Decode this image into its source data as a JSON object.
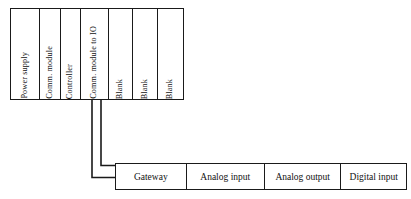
{
  "diagram": {
    "rack": {
      "name": "controller-rack",
      "slots": [
        {
          "label": "Power supply"
        },
        {
          "label": "Comm. module"
        },
        {
          "label": "Controller"
        },
        {
          "label": "Comm. module to IO"
        },
        {
          "label": "Blank"
        },
        {
          "label": "Blank"
        },
        {
          "label": "Blank"
        }
      ]
    },
    "io_bar": {
      "name": "io-module-bar",
      "modules": [
        {
          "label": "Gateway"
        },
        {
          "label": "Analog input"
        },
        {
          "label": "Analog output"
        },
        {
          "label": "Digital input"
        }
      ]
    },
    "connectors": [
      {
        "name": "comm-to-gateway-upper",
        "from": "Comm. module to IO",
        "to": "Gateway"
      },
      {
        "name": "comm-to-gateway-lower",
        "from": "Comm. module to IO",
        "to": "Gateway"
      }
    ],
    "colors": {
      "line": "#1a1a1a",
      "text": "#111111",
      "background": "#ffffff"
    }
  }
}
